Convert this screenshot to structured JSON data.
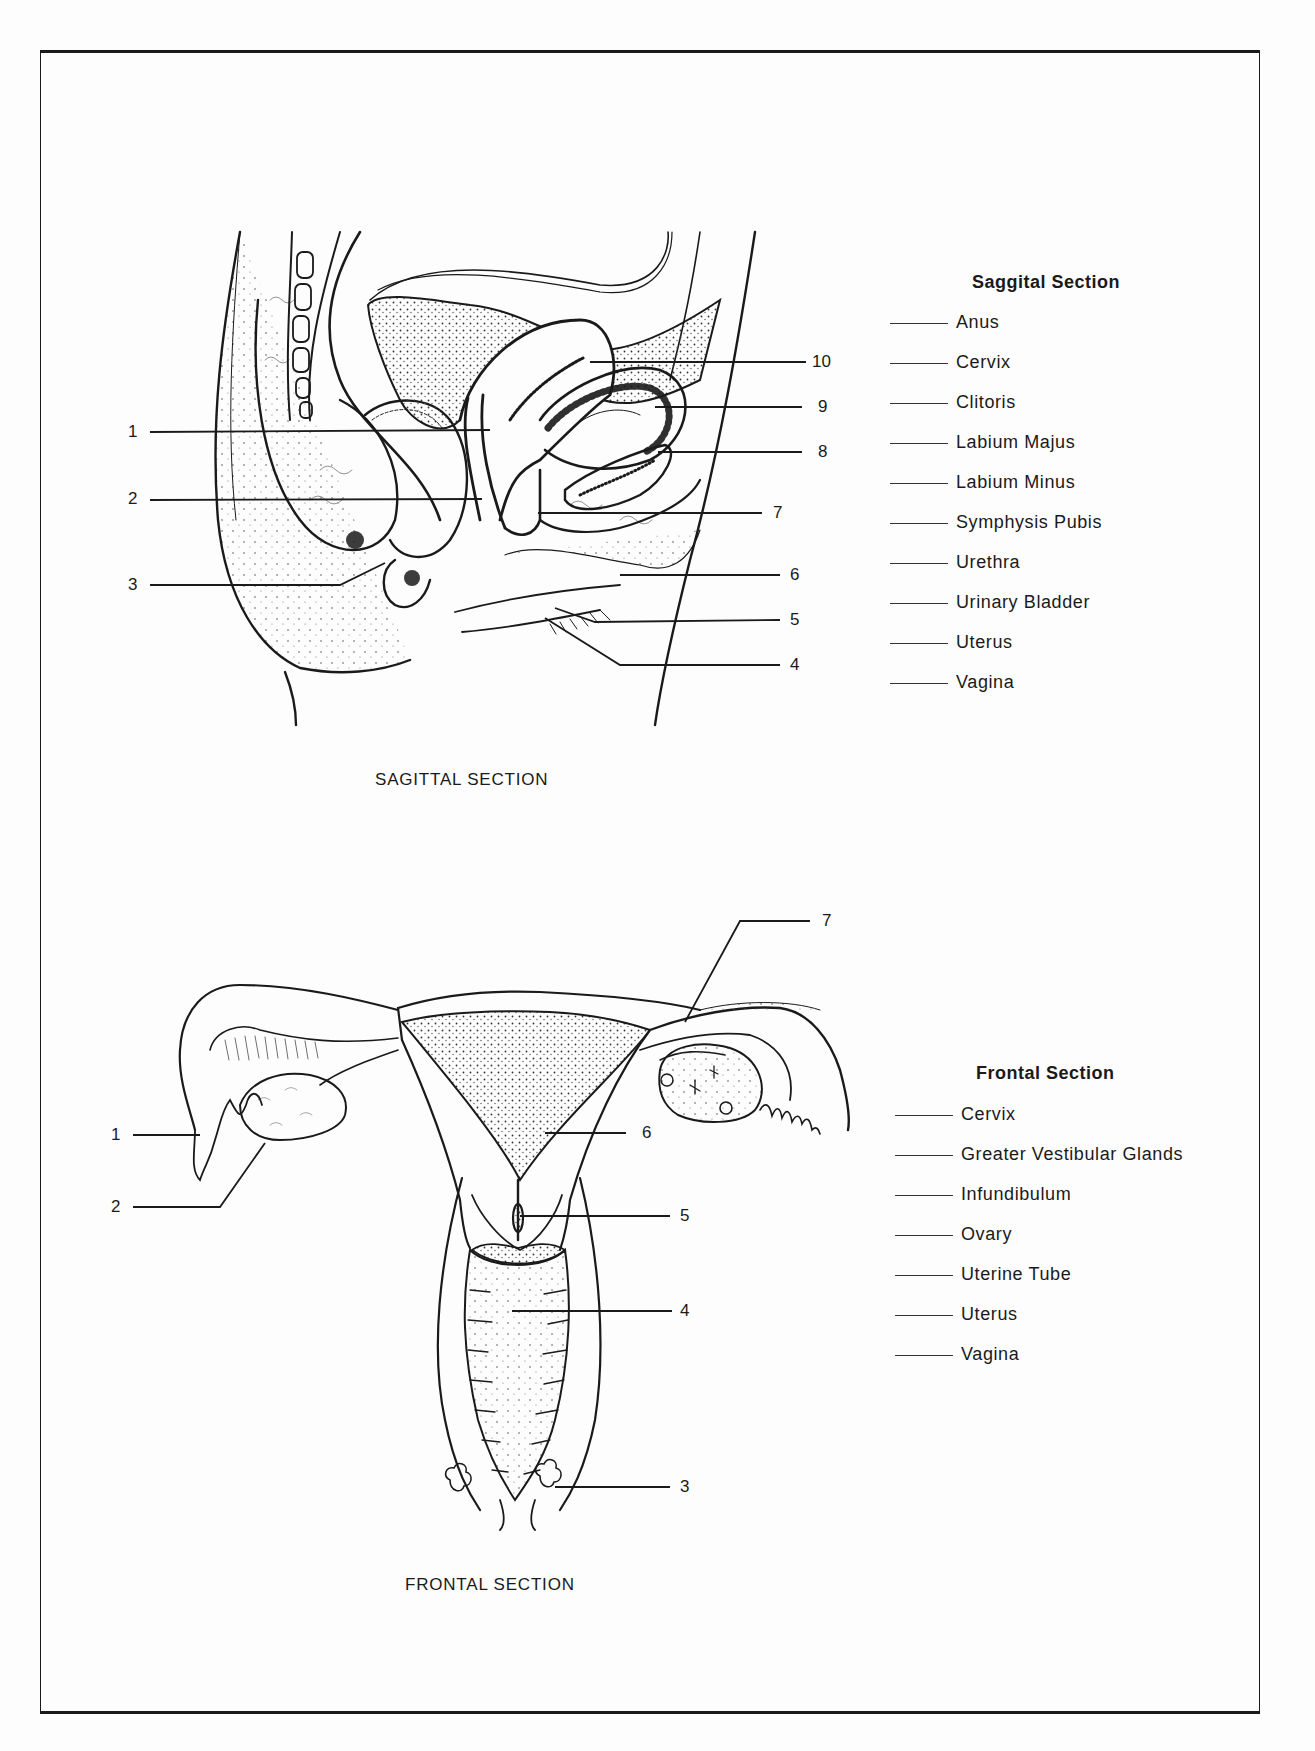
{
  "sagittal": {
    "caption": "SAGITTAL SECTION",
    "list_title": "Saggital Section",
    "labels": [
      "Anus",
      "Cervix",
      "Clitoris",
      "Labium Majus",
      "Labium Minus",
      "Symphysis Pubis",
      "Urethra",
      "Urinary Bladder",
      "Uterus",
      "Vagina"
    ],
    "callouts": [
      "1",
      "2",
      "3",
      "4",
      "5",
      "6",
      "7",
      "8",
      "9",
      "10"
    ]
  },
  "frontal": {
    "caption": "FRONTAL SECTION",
    "list_title": "Frontal Section",
    "labels": [
      "Cervix",
      "Greater Vestibular Glands",
      "Infundibulum",
      "Ovary",
      "Uterine Tube",
      "Uterus",
      "Vagina"
    ],
    "callouts": [
      "1",
      "2",
      "3",
      "4",
      "5",
      "6",
      "7"
    ]
  },
  "colors": {
    "ink": "#1a1a1a",
    "paper": "#fdfdfd"
  }
}
